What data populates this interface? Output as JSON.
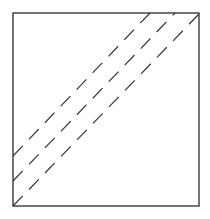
{
  "diagram": {
    "type": "square-with-dashed-diagonals",
    "canvas": {
      "width": 210,
      "height": 219
    },
    "square": {
      "x1": 13,
      "y1": 13,
      "x2": 199,
      "y2": 206,
      "stroke": "#3a3a3a",
      "stroke_width": 1.4
    },
    "dashed_lines": [
      {
        "name": "main-diagonal",
        "x1": 13,
        "y1": 206,
        "x2": 199,
        "y2": 14
      },
      {
        "name": "offset-line-1",
        "x1": 13,
        "y1": 181,
        "x2": 175,
        "y2": 13
      },
      {
        "name": "offset-line-2",
        "x1": 13,
        "y1": 156,
        "x2": 150,
        "y2": 13
      }
    ],
    "dash_style": {
      "dasharray": "14 9",
      "stroke": "#333333",
      "stroke_width": 1.2
    }
  }
}
